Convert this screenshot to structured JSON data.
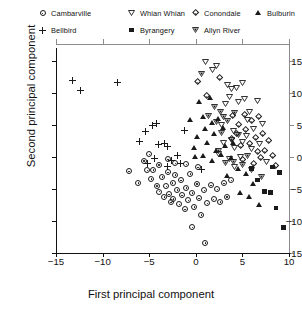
{
  "chart_data": {
    "type": "scatter",
    "title": "",
    "xlabel": "First principal component",
    "ylabel": "Second principal component",
    "xlim": [
      -15,
      10
    ],
    "ylim": [
      -15,
      17
    ],
    "xticks": [
      -15,
      -10,
      -5,
      0,
      5,
      10
    ],
    "yticks": [
      15,
      10,
      5,
      0,
      -5,
      -10,
      -15
    ],
    "xtick_labels": [
      "−15",
      "−10",
      "−5",
      "0",
      "5",
      "10"
    ],
    "ytick_labels": [
      "15",
      "10",
      "5",
      "0",
      "−5",
      "−10",
      "−15"
    ],
    "grid": false,
    "legend_position": "top",
    "series": [
      {
        "name": "Cambarville",
        "marker": "circle-dot",
        "filled": false,
        "points": [
          [
            -7.2,
            -2.2
          ],
          [
            -5.6,
            -0.6
          ],
          [
            -5.2,
            -2.1
          ],
          [
            -4.8,
            -3.4
          ],
          [
            -4.6,
            -2.0
          ],
          [
            -4.2,
            -4.5
          ],
          [
            -4.0,
            -1.2
          ],
          [
            -3.9,
            -5.4
          ],
          [
            -3.6,
            -3.1
          ],
          [
            -3.4,
            -6.2
          ],
          [
            -3.2,
            -4.6
          ],
          [
            -3.0,
            -2.4
          ],
          [
            -2.9,
            -5.8
          ],
          [
            -2.7,
            -7.1
          ],
          [
            -2.5,
            -4.0
          ],
          [
            -2.4,
            -6.5
          ],
          [
            -2.2,
            -2.8
          ],
          [
            -2.0,
            -5.1
          ],
          [
            -1.8,
            -7.4
          ],
          [
            -1.6,
            -3.6
          ],
          [
            -1.5,
            -6.0
          ],
          [
            -1.2,
            -8.2
          ],
          [
            -1.0,
            -4.8
          ],
          [
            -0.8,
            -6.8
          ],
          [
            -0.6,
            -2.6
          ],
          [
            -0.4,
            -5.6
          ],
          [
            -0.2,
            -7.8
          ],
          [
            0.1,
            -4.2
          ],
          [
            0.3,
            -6.4
          ],
          [
            0.6,
            -9.0
          ],
          [
            0.9,
            -5.2
          ],
          [
            1.2,
            -7.2
          ],
          [
            1.6,
            -4.4
          ],
          [
            1.9,
            -6.6
          ],
          [
            2.3,
            -5.0
          ],
          [
            2.6,
            -7.0
          ],
          [
            3.0,
            -4.1
          ],
          [
            3.3,
            -6.2
          ],
          [
            -3.0,
            -0.4
          ],
          [
            -2.2,
            -1.0
          ],
          [
            -1.0,
            -1.1
          ],
          [
            0.2,
            -1.6
          ],
          [
            -0.4,
            -11.0
          ],
          [
            1.0,
            -13.4
          ],
          [
            3.8,
            -3.6
          ],
          [
            -5.0,
            0.4
          ],
          [
            -6.2,
            -4.0
          ]
        ]
      },
      {
        "name": "Bellbird",
        "marker": "plus",
        "filled": true,
        "points": [
          [
            -13.2,
            12.0
          ],
          [
            -12.4,
            10.4
          ],
          [
            -8.4,
            11.6
          ],
          [
            -5.4,
            4.0
          ],
          [
            -4.6,
            4.9
          ],
          [
            -4.2,
            5.2
          ],
          [
            -4.0,
            2.0
          ],
          [
            -3.4,
            2.1
          ],
          [
            -3.0,
            1.6
          ],
          [
            -6.0,
            2.4
          ],
          [
            -2.6,
            -0.6
          ],
          [
            -3.0,
            -1.5
          ],
          [
            -1.6,
            -1.0
          ],
          [
            -1.2,
            4.2
          ],
          [
            0.6,
            -2.0
          ],
          [
            -5.2,
            -1.0
          ],
          [
            -4.4,
            -0.2
          ],
          [
            -2.0,
            0.2
          ]
        ]
      },
      {
        "name": "Whian Whian",
        "marker": "triangle-down",
        "filled": false,
        "points": [
          [
            1.0,
            14.8
          ],
          [
            1.8,
            13.6
          ],
          [
            2.2,
            14.2
          ],
          [
            3.4,
            11.2
          ],
          [
            3.8,
            10.6
          ],
          [
            3.6,
            9.4
          ],
          [
            4.4,
            10.8
          ],
          [
            5.0,
            11.6
          ],
          [
            4.6,
            8.6
          ],
          [
            5.2,
            9.0
          ],
          [
            6.6,
            8.8
          ],
          [
            3.2,
            8.2
          ],
          [
            5.8,
            7.0
          ],
          [
            4.0,
            4.0
          ],
          [
            5.4,
            3.2
          ],
          [
            6.2,
            4.4
          ],
          [
            3.0,
            2.2
          ],
          [
            4.2,
            1.4
          ],
          [
            5.0,
            2.4
          ],
          [
            6.0,
            1.2
          ],
          [
            2.4,
            0.4
          ],
          [
            3.6,
            -0.4
          ],
          [
            4.8,
            0.0
          ],
          [
            7.2,
            5.2
          ],
          [
            6.8,
            2.0
          ],
          [
            5.6,
            5.8
          ],
          [
            2.8,
            5.0
          ],
          [
            7.6,
            -0.8
          ],
          [
            4.2,
            -1.6
          ]
        ]
      },
      {
        "name": "Byrangery",
        "marker": "square",
        "filled": true,
        "points": [
          [
            6.6,
            -3.6
          ],
          [
            7.4,
            -5.4
          ],
          [
            8.0,
            -5.6
          ],
          [
            8.6,
            -8.0
          ],
          [
            9.4,
            -11.0
          ],
          [
            6.0,
            -1.8
          ],
          [
            8.2,
            -1.6
          ],
          [
            9.0,
            -2.4
          ]
        ]
      },
      {
        "name": "Conondale",
        "marker": "diamond-dot",
        "filled": false,
        "points": [
          [
            0.2,
            11.8
          ],
          [
            2.6,
            12.4
          ],
          [
            1.2,
            9.6
          ],
          [
            4.0,
            6.4
          ],
          [
            5.2,
            6.6
          ],
          [
            4.6,
            5.0
          ],
          [
            6.0,
            5.6
          ],
          [
            6.8,
            6.2
          ],
          [
            5.4,
            4.2
          ],
          [
            6.4,
            3.0
          ],
          [
            7.2,
            3.6
          ],
          [
            7.8,
            2.6
          ],
          [
            5.8,
            2.0
          ],
          [
            6.6,
            0.8
          ],
          [
            7.4,
            1.0
          ],
          [
            8.2,
            0.2
          ],
          [
            4.8,
            1.8
          ],
          [
            5.0,
            -0.4
          ],
          [
            6.2,
            -1.0
          ],
          [
            7.0,
            -0.2
          ],
          [
            8.6,
            -1.4
          ],
          [
            3.8,
            2.8
          ],
          [
            4.4,
            3.6
          ]
        ]
      },
      {
        "name": "Allyn River",
        "marker": "triangle-down-outline",
        "filled": false,
        "points": [
          [
            0.6,
            13.0
          ],
          [
            2.0,
            7.8
          ],
          [
            2.6,
            7.0
          ],
          [
            3.0,
            6.2
          ],
          [
            1.4,
            6.4
          ],
          [
            2.2,
            5.4
          ],
          [
            3.4,
            5.6
          ],
          [
            4.2,
            6.8
          ],
          [
            2.8,
            3.8
          ],
          [
            3.8,
            2.6
          ],
          [
            4.6,
            3.4
          ],
          [
            5.6,
            0.2
          ],
          [
            4.0,
            -0.8
          ],
          [
            5.0,
            -1.2
          ],
          [
            6.0,
            -2.0
          ],
          [
            3.2,
            -1.0
          ],
          [
            2.4,
            1.0
          ],
          [
            7.0,
            -3.2
          ]
        ]
      },
      {
        "name": "Bulburin",
        "marker": "triangle-up",
        "filled": true,
        "points": [
          [
            0.4,
            8.6
          ],
          [
            1.6,
            9.2
          ],
          [
            0.8,
            6.2
          ],
          [
            1.8,
            5.4
          ],
          [
            2.4,
            6.0
          ],
          [
            1.0,
            4.4
          ],
          [
            2.0,
            3.6
          ],
          [
            3.0,
            4.6
          ],
          [
            0.2,
            3.2
          ],
          [
            1.2,
            2.2
          ],
          [
            2.2,
            1.0
          ],
          [
            3.2,
            1.8
          ],
          [
            4.0,
            2.2
          ],
          [
            -0.2,
            1.4
          ],
          [
            0.8,
            0.2
          ],
          [
            1.8,
            -0.6
          ],
          [
            2.8,
            0.4
          ],
          [
            3.8,
            -0.2
          ],
          [
            4.6,
            -1.8
          ],
          [
            5.4,
            -2.6
          ],
          [
            6.2,
            -4.2
          ],
          [
            4.8,
            -5.6
          ],
          [
            5.8,
            -6.2
          ],
          [
            6.8,
            -7.4
          ],
          [
            3.4,
            -3.0
          ],
          [
            -0.6,
            5.8
          ],
          [
            0.0,
            0.0
          ]
        ]
      }
    ]
  },
  "legend": {
    "items": [
      {
        "label": "Cambarville",
        "marker": "circle-dot",
        "row": 0,
        "col": 0
      },
      {
        "label": "Whian Whian",
        "marker": "triangle-down",
        "row": 0,
        "col": 1
      },
      {
        "label": "Conondale",
        "marker": "diamond-dot",
        "row": 0,
        "col": 2
      },
      {
        "label": "Bulburin",
        "marker": "triangle-up",
        "row": 0,
        "col": 3
      },
      {
        "label": "Bellbird",
        "marker": "plus",
        "row": 1,
        "col": 0
      },
      {
        "label": "Byrangery",
        "marker": "square",
        "row": 1,
        "col": 1
      },
      {
        "label": "Allyn River",
        "marker": "triangle-down-outline",
        "row": 1,
        "col": 2
      }
    ]
  },
  "colors": {
    "marker": "#1a1a1a",
    "axis": "#111111",
    "frame": "#8c8c8c",
    "background": "#ffffff"
  }
}
